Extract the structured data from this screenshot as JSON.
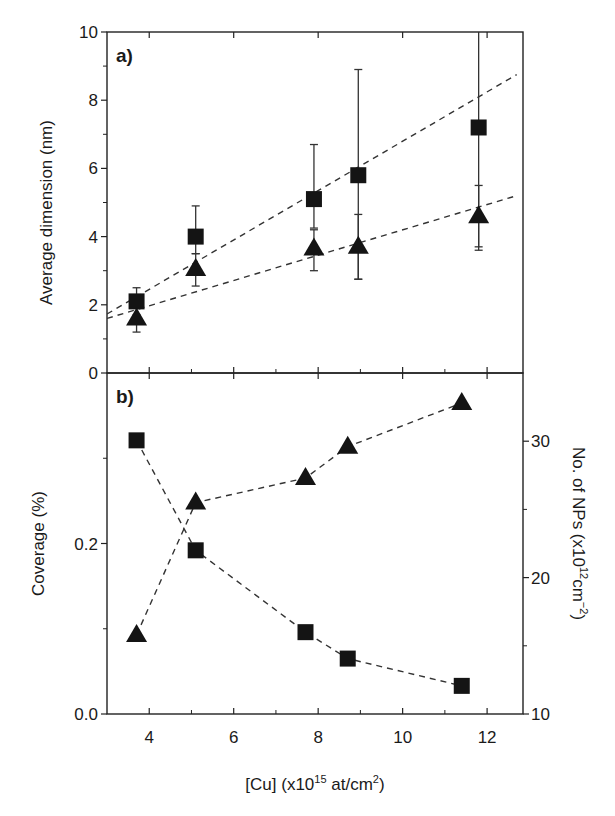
{
  "figure": {
    "x_axis_label": "[Cu] (x10",
    "x_axis_label_sup": "15",
    "x_axis_label_tail": " at/cm",
    "x_axis_label_sup2": "2",
    "x_axis_label_end": ")"
  },
  "chart_data": [
    {
      "type": "scatter",
      "panel_label": "a)",
      "title": "",
      "xlabel": "[Cu] (x10^15 at/cm^2)",
      "ylabel": "Average dimension (nm)",
      "xlim": [
        3,
        12.85
      ],
      "ylim": [
        0,
        10
      ],
      "x_ticks": [
        4,
        6,
        8,
        10,
        12
      ],
      "x_minor_ticks": [
        5,
        7,
        9,
        11
      ],
      "y_ticks": [
        0,
        2,
        4,
        6,
        8,
        10
      ],
      "y_minor_ticks": [
        1,
        3,
        5,
        7,
        9
      ],
      "grid": false,
      "legend": null,
      "series": [
        {
          "name": "squares",
          "marker": "square",
          "x": [
            3.7,
            5.1,
            7.9,
            8.95,
            11.8
          ],
          "y": [
            2.1,
            4.0,
            5.1,
            5.8,
            7.2
          ],
          "err_upper": [
            2.5,
            4.9,
            6.7,
            8.9,
            10.5
          ],
          "err_lower": [
            1.7,
            3.5,
            4.25,
            2.75,
            3.7
          ],
          "fit_line": {
            "x": [
              3.0,
              12.7
            ],
            "y": [
              1.73,
              8.75
            ],
            "style": "dashed"
          }
        },
        {
          "name": "triangles",
          "marker": "triangle",
          "x": [
            3.7,
            5.1,
            7.9,
            8.95,
            11.8
          ],
          "y": [
            1.6,
            3.05,
            3.65,
            3.7,
            4.6
          ],
          "err_upper": [
            1.9,
            3.5,
            4.2,
            4.65,
            5.5
          ],
          "err_lower": [
            1.2,
            2.55,
            3.0,
            2.75,
            3.6
          ],
          "fit_line": {
            "x": [
              3.0,
              12.7
            ],
            "y": [
              1.6,
              5.2
            ],
            "style": "dashed"
          }
        }
      ]
    },
    {
      "type": "scatter",
      "panel_label": "b)",
      "title": "",
      "xlabel": "[Cu] (x10^15 at/cm^2)",
      "ylabel": "Coverage (%)",
      "ylabel_right": "No. of NPs (x10^12 cm^-2)",
      "xlim": [
        3,
        12.85
      ],
      "ylim": [
        0,
        0.4
      ],
      "ylim_right": [
        10,
        35
      ],
      "x_ticks": [
        4,
        6,
        8,
        10,
        12
      ],
      "x_minor_ticks": [
        5,
        7,
        9,
        11
      ],
      "y_ticks": [
        0.0,
        0.2
      ],
      "y_tick_labels": [
        "0.0",
        "0.2"
      ],
      "y_minor_ticks": [
        0.1,
        0.3
      ],
      "y_right_ticks": [
        10,
        20,
        30
      ],
      "y_right_minor_ticks": [
        15,
        25
      ],
      "grid": false,
      "legend": null,
      "series": [
        {
          "name": "Coverage",
          "axis": "left",
          "marker": "square",
          "line": "dashed",
          "x": [
            3.7,
            5.1,
            7.7,
            8.7,
            11.4
          ],
          "y": [
            0.321,
            0.192,
            0.096,
            0.065,
            0.033
          ]
        },
        {
          "name": "No. of NPs",
          "axis": "right",
          "marker": "triangle",
          "line": "dashed",
          "x": [
            3.7,
            5.1,
            7.7,
            8.7,
            11.4
          ],
          "y": [
            15.8,
            25.5,
            27.3,
            29.6,
            32.8
          ]
        }
      ]
    }
  ]
}
